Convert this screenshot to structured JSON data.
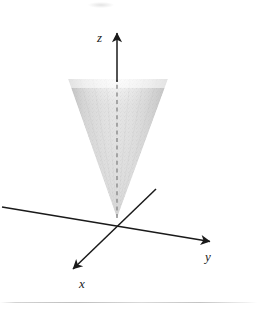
{
  "figure": {
    "background_color": "#ffffff",
    "ink_color": "#1a1a1a",
    "cone_fill_color": "#d5d5d5",
    "width": 257,
    "height": 314
  },
  "axes": {
    "origin": {
      "x": 117,
      "y": 218
    },
    "z": {
      "label": "z",
      "label_position": {
        "x": 97,
        "y": 31
      },
      "arrow_tip": {
        "x": 117,
        "y": 30
      },
      "start": {
        "x": 117,
        "y": 218
      },
      "solid_from_y": 30,
      "solid_to_y": 80,
      "dashed_from_y": 80,
      "dashed_to_y": 218,
      "style": "solid-above-cone-dashed-inside"
    },
    "y": {
      "label": "y",
      "label_position": {
        "x": 205,
        "y": 250
      },
      "arrow_tip": {
        "x": 213,
        "y": 242
      },
      "negative_end": {
        "x": 2,
        "y": 207
      },
      "style": "solid"
    },
    "x": {
      "label": "x",
      "label_position": {
        "x": 79,
        "y": 277
      },
      "arrow_tip": {
        "x": 70,
        "y": 272
      },
      "negative_end": {
        "x": 156,
        "y": 189
      },
      "style": "solid"
    }
  },
  "cone": {
    "name": "shaded-cone",
    "apex": {
      "x": 117,
      "y": 218
    },
    "opening_direction": "upward",
    "top_y": 79,
    "top_left_x": 68,
    "top_right_x": 168,
    "top_edge": "soft-faded",
    "shading": "stippled-gray-gradient",
    "edge_color": "#c2c2c2",
    "center_color": "#e6e6e6"
  },
  "artifacts": {
    "scan_line_y": 302,
    "top_smudge": {
      "x": 88,
      "y": 2
    }
  }
}
